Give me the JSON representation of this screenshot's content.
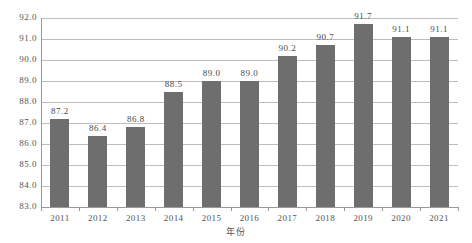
{
  "chart_data": {
    "type": "bar",
    "title": "",
    "subtitle": "",
    "xlabel": "年份",
    "ylabel": "",
    "categories": [
      "2011",
      "2012",
      "2013",
      "2014",
      "2015",
      "2016",
      "2017",
      "2018",
      "2019",
      "2020",
      "2021"
    ],
    "values": [
      87.2,
      86.4,
      86.8,
      88.5,
      89.0,
      89.0,
      90.2,
      90.7,
      91.7,
      91.1,
      91.1
    ],
    "data_labels": [
      "87.2",
      "86.4",
      "86.8",
      "88.5",
      "89.0",
      "89.0",
      "90.2",
      "90.7",
      "91.7",
      "91.1",
      "91.1"
    ],
    "ylim": [
      83.0,
      92.0
    ],
    "ytick_values": [
      92.0,
      91.0,
      90.0,
      89.0,
      88.0,
      87.0,
      86.0,
      85.0,
      84.0,
      83.0
    ],
    "ytick_labels": [
      "92.0",
      "91.0",
      "90.0",
      "89.0",
      "88.0",
      "87.0",
      "86.0",
      "85.0",
      "84.0",
      "83.0"
    ],
    "ystep": 1.0,
    "grid": true,
    "grid_axis": "y",
    "legend": false,
    "legend_position": "none",
    "series": [
      {
        "name": "",
        "values": [
          87.2,
          86.4,
          86.8,
          88.5,
          89.0,
          89.0,
          90.2,
          90.7,
          91.7,
          91.1,
          91.1
        ]
      }
    ],
    "colors": {
      "bar": "#6e6e6e",
      "gridline": "#bdbdbd",
      "axis": "#9a9a9a",
      "background": "#ffffff",
      "text": "#555555"
    }
  }
}
